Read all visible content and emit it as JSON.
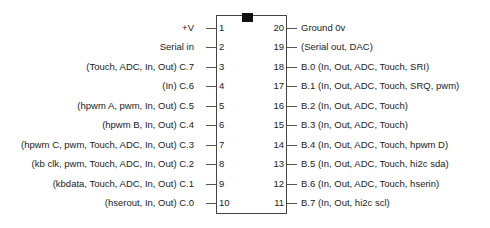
{
  "diagram": {
    "chip": {
      "notch_name": "orientation-notch",
      "outline_color": "#444444",
      "notch_color": "#111111",
      "body_fill": "#ffffff"
    },
    "text_color": "#222222",
    "background_color": "#ffffff"
  },
  "pins": {
    "left": [
      {
        "number": "1",
        "label": "+V"
      },
      {
        "number": "2",
        "label": "Serial in"
      },
      {
        "number": "3",
        "label": "(Touch, ADC, In, Out) C.7"
      },
      {
        "number": "4",
        "label": "(In) C.6"
      },
      {
        "number": "5",
        "label": "(hpwm A, pwm, In, Out) C.5"
      },
      {
        "number": "6",
        "label": "(hpwm B, In, Out) C.4"
      },
      {
        "number": "7",
        "label": "(hpwm C, pwm, Touch, ADC, In, Out) C.3"
      },
      {
        "number": "8",
        "label": "(kb clk, pwm, Touch, ADC, In, Out) C.2"
      },
      {
        "number": "9",
        "label": "(kbdata, Touch, ADC, In, Out) C.1"
      },
      {
        "number": "10",
        "label": "(hserout, In, Out) C.0"
      }
    ],
    "right": [
      {
        "number": "20",
        "label": "Ground 0v"
      },
      {
        "number": "19",
        "label": "(Serial out,  DAC)"
      },
      {
        "number": "18",
        "label": "B.0 (In, Out, ADC, Touch, SRI)"
      },
      {
        "number": "17",
        "label": "B.1 (In, Out, ADC, Touch, SRQ, pwm)"
      },
      {
        "number": "16",
        "label": "B.2 (In, Out, ADC, Touch)"
      },
      {
        "number": "15",
        "label": "B.3 (In, Out, ADC, Touch)"
      },
      {
        "number": "14",
        "label": "B.4 (In, Out, ADC, Touch, hpwm D)"
      },
      {
        "number": "13",
        "label": "B.5 (In, Out, ADC, Touch, hi2c sda)"
      },
      {
        "number": "12",
        "label": "B.6 (In, Out, ADC, Touch, hserin)"
      },
      {
        "number": "11",
        "label": "B.7 (In, Out, hi2c scl)"
      }
    ]
  }
}
